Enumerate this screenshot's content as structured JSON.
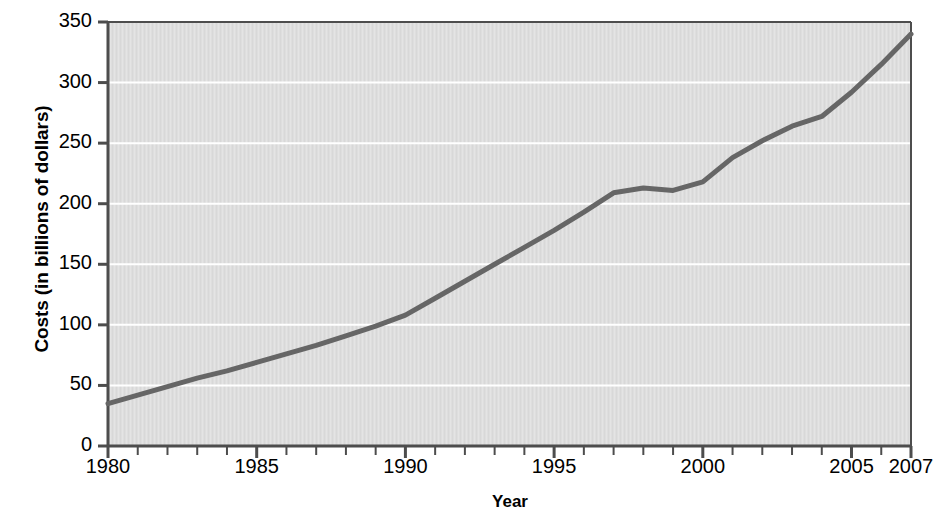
{
  "chart_data": {
    "type": "line",
    "title": "",
    "xlabel": "Year",
    "ylabel": "Costs (in billions of dollars)",
    "xlim": [
      1980,
      2007
    ],
    "ylim": [
      0,
      350
    ],
    "grid": true,
    "legend": "none",
    "x_tick_labels": [
      "1980",
      "1985",
      "1990",
      "1995",
      "2000",
      "2005",
      "2007"
    ],
    "x_tick_values": [
      1980,
      1985,
      1990,
      1995,
      2000,
      2005,
      2007
    ],
    "x_minor_ticks_every": 1,
    "y_tick_labels": [
      "0",
      "50",
      "100",
      "150",
      "200",
      "250",
      "300",
      "350"
    ],
    "y_tick_values": [
      0,
      50,
      100,
      150,
      200,
      250,
      300,
      350
    ],
    "series": [
      {
        "name": "Costs",
        "color": "#666666",
        "line_width": 5,
        "x": [
          1980,
          1981,
          1982,
          1983,
          1984,
          1985,
          1986,
          1987,
          1988,
          1989,
          1990,
          1991,
          1992,
          1993,
          1994,
          1995,
          1996,
          1997,
          1998,
          1999,
          2000,
          2001,
          2002,
          2003,
          2004,
          2005,
          2006,
          2007
        ],
        "values": [
          35,
          42,
          49,
          56,
          62,
          69,
          76,
          83,
          91,
          99,
          108,
          122,
          136,
          150,
          164,
          178,
          193,
          209,
          213,
          211,
          218,
          238,
          252,
          264,
          272,
          292,
          315,
          340
        ]
      }
    ],
    "colors": {
      "plot_background": "#dedede",
      "gridline": "#ffffff",
      "axis": "#4d4d4d",
      "line": "#666666",
      "text": "#000000",
      "page_background": "#ffffff"
    },
    "geometry": {
      "plot_left": 108,
      "plot_right": 911,
      "plot_top": 22,
      "plot_bottom": 446
    }
  }
}
